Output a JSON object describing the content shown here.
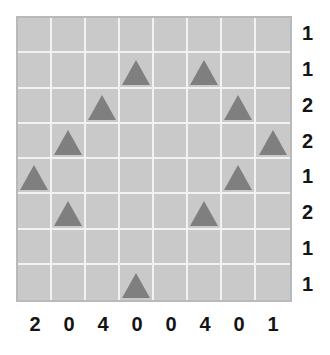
{
  "puzzle": {
    "title": "triangle-grid-puzzle",
    "grid": {
      "rows": 8,
      "cols": 8,
      "cell_icon": "triangle-icon",
      "background_color": "#c9c9c9",
      "gridline_color": "#f2f2f2",
      "border_color": "#b9b9b9",
      "triangle_color": "#7f7f7f",
      "label_color": "#141414",
      "cells": [
        [
          0,
          0,
          0,
          0,
          0,
          0,
          0,
          0
        ],
        [
          0,
          0,
          0,
          1,
          0,
          1,
          0,
          0
        ],
        [
          0,
          0,
          1,
          0,
          0,
          0,
          1,
          0
        ],
        [
          0,
          1,
          0,
          0,
          0,
          0,
          0,
          1
        ],
        [
          1,
          0,
          0,
          0,
          0,
          0,
          1,
          0
        ],
        [
          0,
          1,
          0,
          0,
          0,
          1,
          0,
          0
        ],
        [
          0,
          0,
          0,
          0,
          0,
          0,
          0,
          0
        ],
        [
          0,
          0,
          0,
          1,
          0,
          0,
          0,
          0
        ]
      ]
    },
    "row_labels": [
      "1",
      "1",
      "2",
      "2",
      "1",
      "2",
      "1",
      "1"
    ],
    "col_labels": [
      "2",
      "0",
      "4",
      "0",
      "0",
      "4",
      "0",
      "1"
    ]
  },
  "chart_data": {
    "type": "heatmap",
    "title": "",
    "xlabel": "",
    "ylabel": "",
    "categories": [
      "1",
      "2",
      "3",
      "4",
      "5",
      "6",
      "7",
      "8"
    ],
    "row_categories": [
      "1",
      "2",
      "3",
      "4",
      "5",
      "6",
      "7",
      "8"
    ],
    "values": [
      [
        0,
        0,
        0,
        0,
        0,
        0,
        0,
        0
      ],
      [
        0,
        0,
        0,
        1,
        0,
        1,
        0,
        0
      ],
      [
        0,
        0,
        1,
        0,
        0,
        0,
        1,
        0
      ],
      [
        0,
        1,
        0,
        0,
        0,
        0,
        0,
        1
      ],
      [
        1,
        0,
        0,
        0,
        0,
        0,
        1,
        0
      ],
      [
        0,
        1,
        0,
        0,
        0,
        1,
        0,
        0
      ],
      [
        0,
        0,
        0,
        0,
        0,
        0,
        0,
        0
      ],
      [
        0,
        0,
        0,
        1,
        0,
        0,
        0,
        0
      ]
    ],
    "row_annotations": [
      "1",
      "1",
      "2",
      "2",
      "1",
      "2",
      "1",
      "1"
    ],
    "col_annotations": [
      "2",
      "0",
      "4",
      "0",
      "0",
      "4",
      "0",
      "1"
    ],
    "marker": "triangle",
    "grid": true,
    "legend": "none"
  }
}
